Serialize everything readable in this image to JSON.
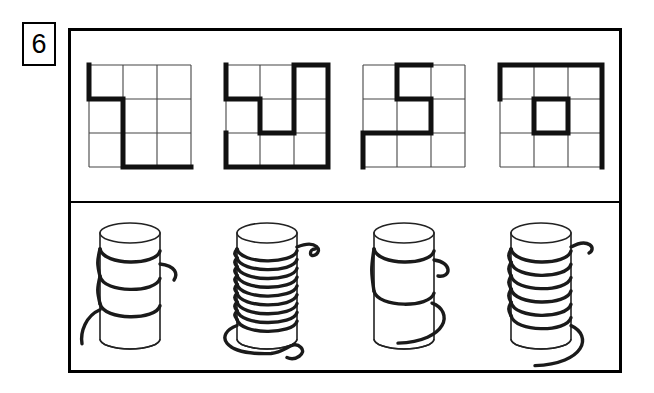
{
  "item": {
    "number": "6",
    "number_label": "6"
  },
  "frame": {
    "panels": [
      {
        "id": "top-panel",
        "kind": "grid-path-figures",
        "count": 4
      },
      {
        "id": "bottom-panel",
        "kind": "cylinder-thread-figures",
        "count": 4
      }
    ]
  },
  "grids": [
    {
      "name": "grid-figure-1",
      "rows": 3,
      "cols": 3,
      "path": "M 0,0 L 0,1 L 1,1 L 1,3 L 3,3"
    },
    {
      "name": "grid-figure-2",
      "rows": 3,
      "cols": 3,
      "path": "M 0,0 L 0,1 L 1,1 L 1,2 L 2,2 L 2,0 L 3,0 L 3,3 L 0,3 L 0,2"
    },
    {
      "name": "grid-figure-3",
      "rows": 3,
      "cols": 3,
      "path": "M 2,0 L 1,0 L 1,1 L 2,1 L 2,2 L 0,2 L 0,3"
    },
    {
      "name": "grid-figure-4",
      "rows": 3,
      "cols": 3,
      "path": "M 0,1 L 0,0 L 3,0 L 3,3 M 1,1 L 2,1 L 2,2 L 1,2 Z"
    }
  ],
  "cylinders": [
    {
      "name": "cylinder-figure-1",
      "coils": 3,
      "coil_density": "loose"
    },
    {
      "name": "cylinder-figure-2",
      "coils": 9,
      "coil_density": "tight"
    },
    {
      "name": "cylinder-figure-3",
      "coils": 2,
      "coil_density": "very-loose"
    },
    {
      "name": "cylinder-figure-4",
      "coils": 6,
      "coil_density": "medium"
    }
  ],
  "colors": {
    "ink": "#000000",
    "grid_line": "#444444",
    "thick_line": "#111111",
    "background": "#ffffff"
  }
}
